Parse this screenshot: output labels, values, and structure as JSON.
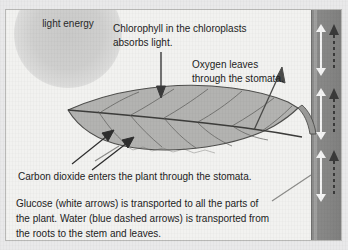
{
  "figure": {
    "background_color": "#f2f2f0",
    "frame_border_color": "#b9b9b7"
  },
  "sun": {
    "label": "light\nenergy",
    "icon": "sun-glow-icon",
    "color": "#cfcfce"
  },
  "labels": {
    "chlorophyll": "Chlorophyll in the chloroplasts\nabsorbs light.",
    "oxygen": "Oxygen leaves\nthrough the stomata.",
    "carbon_dioxide": "Carbon dioxide enters the plant through the stomata.",
    "transport": "Glucose (white arrows) is  transported to all the parts of\nthe plant. Water (blue dashed arrows) is transported from\nthe roots to the stem and leaves."
  },
  "leaf": {
    "name": "leaf-blade",
    "fill_color": "#b3b3b1",
    "outline_color": "#4a4a4a",
    "vein_color": "#5a5a58"
  },
  "stem": {
    "name": "plant-stem",
    "fill_color": "#868685",
    "glucose_arrow_color": "#f4f4f4",
    "water_arrow_color": "#3a3a3a",
    "glucose_arrow_count": 3,
    "water_arrow_count": 3
  },
  "arrows": {
    "light_to_leaf": "downward arrow from chlorophyll label to leaf",
    "oxygen_out": "upward-right arrow leaving the leaf surface",
    "co2_in_1": "upward-right arrow entering leaf underside",
    "co2_in_2": "upward-right arrow entering leaf underside",
    "glucose_pointer": "leader line from transport text to stem arrow",
    "co2_pointer": "leader line from carbon dioxide text to leaf"
  }
}
